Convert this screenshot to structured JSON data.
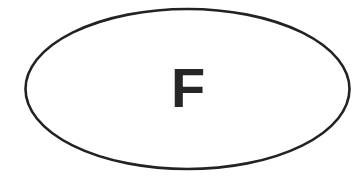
{
  "diagram": {
    "shape": "ellipse",
    "label": "F",
    "stroke_color": "#222222",
    "fill_color": "#ffffff",
    "text_color": "#262626"
  }
}
